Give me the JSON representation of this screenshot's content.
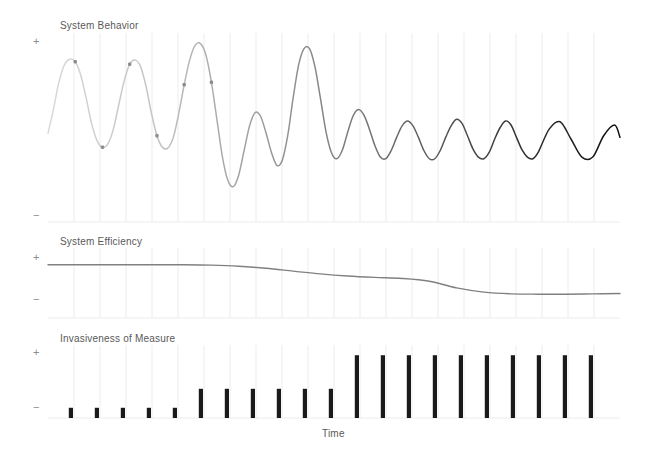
{
  "figure": {
    "width": 646,
    "height": 458,
    "background": "#ffffff",
    "xlabel": "Time"
  },
  "axis": {
    "plus": "+",
    "minus": "−"
  },
  "panels": [
    {
      "id": "system-behavior",
      "title": "System Behavior",
      "plot": {
        "x": 48,
        "y": 33,
        "width": 572,
        "height": 189
      },
      "title_pos": {
        "x": 60,
        "y": 27
      },
      "plus_pos": {
        "x": 33,
        "y": 36
      },
      "minus_pos": {
        "x": 33,
        "y": 212
      }
    },
    {
      "id": "system-efficiency",
      "title": "System Efficiency",
      "plot": {
        "x": 48,
        "y": 248,
        "width": 572,
        "height": 70
      },
      "title_pos": {
        "x": 60,
        "y": 242
      },
      "plus_pos": {
        "x": 33,
        "y": 253
      },
      "minus_pos": {
        "x": 33,
        "y": 295
      }
    },
    {
      "id": "invasiveness-of-measure",
      "title": "Invasiveness of Measure",
      "plot": {
        "x": 48,
        "y": 345,
        "width": 572,
        "height": 73
      },
      "title_pos": {
        "x": 60,
        "y": 340
      },
      "plus_pos": {
        "x": 33,
        "y": 347
      },
      "minus_pos": {
        "x": 33,
        "y": 404
      }
    }
  ],
  "chart_data": [
    {
      "type": "line",
      "id": "system-behavior",
      "title": "System Behavior",
      "xlabel": "Time",
      "ylabel": "",
      "ylim": [
        -1.15,
        1.15
      ],
      "xlim": [
        0,
        21
      ],
      "grid": true,
      "grid_axis": "x",
      "grid_count": 21,
      "description": "Damped oscillation: amplitude decays while frequency rises and stroke darkens from light gray to black from left to right.",
      "line_color_start": "#d9d9d9",
      "line_color_end": "#0d0d0d",
      "marker_color": "#8c8c8c",
      "markers_x": [
        1.0,
        2.0,
        3.0,
        4.0,
        5.0,
        6.0
      ],
      "series": [
        {
          "name": "behavior",
          "x": [
            0.0,
            0.2,
            0.4,
            0.6,
            0.8,
            1.0,
            1.2,
            1.4,
            1.6,
            1.8,
            2.0,
            2.2,
            2.4,
            2.6,
            2.8,
            3.0,
            3.2,
            3.4,
            3.6,
            3.8,
            4.0,
            4.2,
            4.4,
            4.6,
            4.8,
            5.0,
            5.2,
            5.4,
            5.6,
            5.8,
            6.0,
            6.2,
            6.4,
            6.6,
            6.8,
            7.0,
            7.2,
            7.4,
            7.6,
            7.8,
            8.0,
            8.2,
            8.4,
            8.6,
            8.8,
            9.0,
            9.2,
            9.4,
            9.6,
            9.8,
            10.0,
            10.2,
            10.4,
            10.6,
            10.8,
            11.0,
            11.2,
            11.4,
            11.6,
            11.8,
            12.0,
            12.2,
            12.4,
            12.6,
            12.8,
            13.0,
            13.2,
            13.4,
            13.6,
            13.8,
            14.0,
            14.2,
            14.4,
            14.6,
            14.8,
            15.0,
            15.2,
            15.4,
            15.6,
            15.8,
            16.0,
            16.2,
            16.4,
            16.6,
            16.8,
            17.0,
            17.2,
            17.4,
            17.6,
            17.8,
            18.0,
            18.4,
            18.8,
            19.2,
            19.6,
            20.0,
            20.4,
            20.8,
            21.0
          ],
          "y": [
            -0.07,
            0.22,
            0.55,
            0.76,
            0.83,
            0.8,
            0.64,
            0.36,
            0.05,
            -0.16,
            -0.24,
            -0.2,
            -0.02,
            0.28,
            0.57,
            0.77,
            0.82,
            0.74,
            0.5,
            0.17,
            -0.1,
            -0.24,
            -0.25,
            -0.12,
            0.17,
            0.52,
            0.82,
            1.0,
            1.02,
            0.88,
            0.55,
            0.1,
            -0.35,
            -0.64,
            -0.72,
            -0.58,
            -0.28,
            0.02,
            0.18,
            0.14,
            -0.06,
            -0.3,
            -0.46,
            -0.4,
            -0.1,
            0.36,
            0.76,
            0.96,
            0.96,
            0.74,
            0.36,
            -0.04,
            -0.3,
            -0.38,
            -0.28,
            -0.06,
            0.14,
            0.22,
            0.15,
            -0.02,
            -0.22,
            -0.36,
            -0.38,
            -0.28,
            -0.12,
            0.02,
            0.08,
            0.02,
            -0.12,
            -0.28,
            -0.38,
            -0.38,
            -0.28,
            -0.12,
            0.02,
            0.1,
            0.05,
            -0.1,
            -0.26,
            -0.36,
            -0.38,
            -0.3,
            -0.14,
            0.0,
            0.08,
            0.03,
            -0.12,
            -0.27,
            -0.36,
            -0.38,
            -0.3,
            -0.02,
            0.07,
            -0.14,
            -0.36,
            -0.36,
            -0.1,
            0.03,
            -0.12
          ]
        }
      ]
    },
    {
      "type": "line",
      "id": "system-efficiency",
      "title": "System Efficiency",
      "xlabel": "Time",
      "ylabel": "",
      "ylim": [
        -1.0,
        1.0
      ],
      "xlim": [
        0,
        21
      ],
      "grid": true,
      "grid_axis": "x",
      "grid_count": 21,
      "description": "Efficiency holds high and flat, declines gradually from mid-range, drops more steeply, then levels off low.",
      "line_color": "#808080",
      "series": [
        {
          "name": "efficiency",
          "x": [
            0,
            1,
            2,
            3,
            4,
            5,
            6,
            7,
            8,
            9,
            10,
            11,
            12,
            13,
            14,
            15,
            16,
            17,
            18,
            19,
            20,
            21
          ],
          "y": [
            0.52,
            0.52,
            0.52,
            0.52,
            0.52,
            0.52,
            0.51,
            0.48,
            0.42,
            0.34,
            0.26,
            0.2,
            0.16,
            0.13,
            0.05,
            -0.14,
            -0.26,
            -0.31,
            -0.32,
            -0.32,
            -0.31,
            -0.3
          ]
        }
      ]
    },
    {
      "type": "bar",
      "id": "invasiveness-of-measure",
      "title": "Invasiveness of Measure",
      "xlabel": "Time",
      "ylabel": "",
      "ylim": [
        0,
        1.0
      ],
      "grid": true,
      "grid_axis": "x",
      "grid_count": 21,
      "bar_color": "#1a1a1a",
      "description": "Bar heights step up in three tiers: five short bars, six medium bars, then ten tall bars.",
      "categories": [
        "1",
        "2",
        "3",
        "4",
        "5",
        "6",
        "7",
        "8",
        "9",
        "10",
        "11",
        "12",
        "13",
        "14",
        "15",
        "16",
        "17",
        "18",
        "19",
        "20",
        "21"
      ],
      "values": [
        0.14,
        0.14,
        0.14,
        0.14,
        0.14,
        0.4,
        0.4,
        0.4,
        0.4,
        0.4,
        0.4,
        0.86,
        0.86,
        0.86,
        0.86,
        0.86,
        0.86,
        0.86,
        0.86,
        0.86,
        0.86
      ]
    }
  ]
}
